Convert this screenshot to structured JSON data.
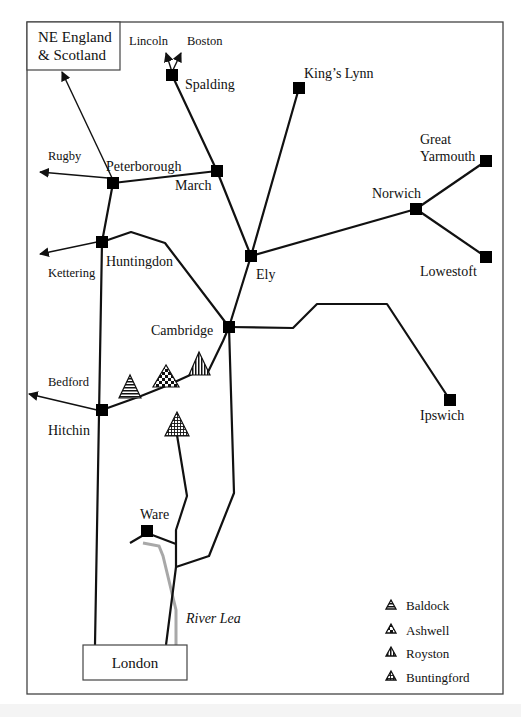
{
  "map": {
    "title": "Railway network of East Anglia and the Cambridge region",
    "boxes": {
      "ne": {
        "line1": "NE England",
        "line2": "& Scotland"
      },
      "london": "London"
    },
    "stations": {
      "spalding": "Spalding",
      "kings_lynn": "King’s Lynn",
      "peterborough": "Peterborough",
      "march": "March",
      "huntingdon": "Huntingdon",
      "ely": "Ely",
      "norwich": "Norwich",
      "great_yarmouth_1": "Great",
      "great_yarmouth_2": "Yarmouth",
      "lowestoft": "Lowestoft",
      "cambridge": "Cambridge",
      "ipswich": "Ipswich",
      "hitchin": "Hitchin",
      "ware": "Ware"
    },
    "destinations": {
      "lincoln": "Lincoln",
      "boston": "Boston",
      "rugby": "Rugby",
      "kettering": "Kettering",
      "bedford": "Bedford"
    },
    "river": "River Lea",
    "legend": [
      {
        "label": "Baldock",
        "pattern": "horizontal-stripes"
      },
      {
        "label": "Ashwell",
        "pattern": "checkerboard"
      },
      {
        "label": "Royston",
        "pattern": "vertical-stripes"
      },
      {
        "label": "Buntingford",
        "pattern": "grid"
      }
    ],
    "colors": {
      "line": "#111111",
      "river": "#a8a8a8",
      "frame": "#444444"
    }
  }
}
